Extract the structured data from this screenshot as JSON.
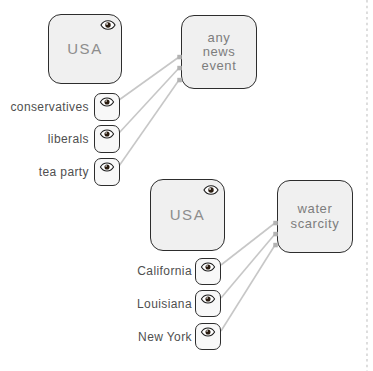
{
  "palette": {
    "background": "#ffffff",
    "node_fill": "#f0f0f0",
    "observer_fill": "#f8f8f8",
    "node_border": "#2d2d2d",
    "node_text": "#8d8d8d",
    "label_text": "#4f4f4f",
    "line": "#c7c7c7",
    "connector_dot": "#b3b3b3",
    "panel_divider": "#cccccc"
  },
  "icons": {
    "observer_toggle": "eye-icon"
  },
  "groups": [
    {
      "container": {
        "label": "USA"
      },
      "target": {
        "label": "any news event",
        "label_multiline": "any\nnews\nevent"
      },
      "observers": [
        {
          "label": "conservatives"
        },
        {
          "label": "liberals"
        },
        {
          "label": "tea party"
        }
      ]
    },
    {
      "container": {
        "label": "USA"
      },
      "target": {
        "label": "water scarcity",
        "label_multiline": "water\nscarcity"
      },
      "observers": [
        {
          "label": "California"
        },
        {
          "label": "Louisiana"
        },
        {
          "label": "New York"
        }
      ]
    }
  ]
}
